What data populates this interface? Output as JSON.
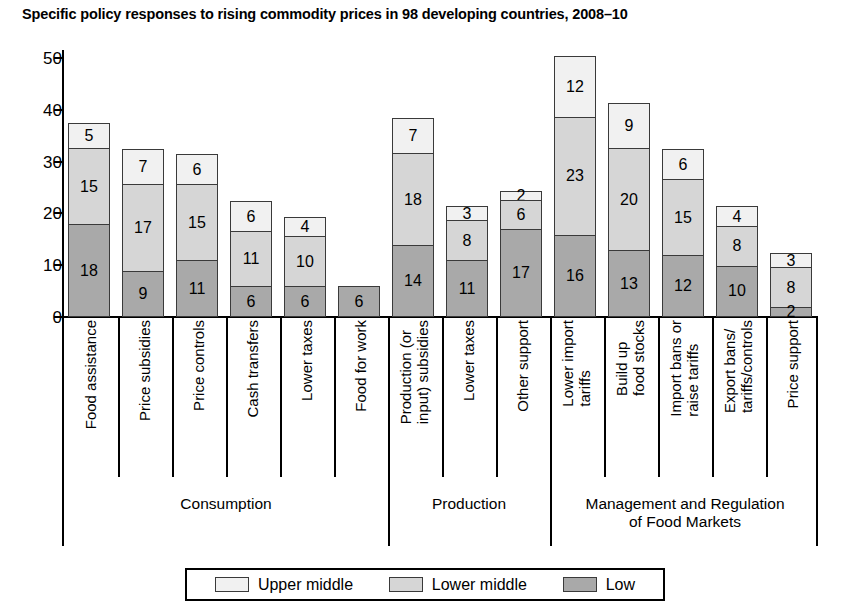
{
  "chart_data": {
    "type": "bar",
    "subtype": "stacked-vertical",
    "title": "Specific policy responses to rising commodity prices in 98 developing countries, 2008–10",
    "xlabel": "",
    "ylabel": "",
    "ylim": [
      0,
      50
    ],
    "yticks": [
      0,
      10,
      20,
      30,
      40,
      50
    ],
    "grid": false,
    "legend_position": "bottom",
    "categories": [
      "Food assistance",
      "Price subsidies",
      "Price controls",
      "Cash transfers",
      "Lower taxes",
      "Food for work",
      "Production (or\ninput) subsidies",
      "Lower taxes",
      "Other support",
      "Lower import\ntariffs",
      "Build up\nfood stocks",
      "Import bans or\nraise tariffs",
      "Export bans/\ntariffs/controls",
      "Price support"
    ],
    "series": [
      {
        "name": "Low",
        "color": "#a9a9a9",
        "values": [
          18,
          9,
          11,
          6,
          6,
          6,
          14,
          11,
          17,
          16,
          13,
          12,
          10,
          2
        ]
      },
      {
        "name": "Lower middle",
        "color": "#d6d6d6",
        "values": [
          15,
          17,
          15,
          11,
          10,
          null,
          18,
          8,
          6,
          23,
          20,
          15,
          8,
          8
        ]
      },
      {
        "name": "Upper middle",
        "color": "#f1f1f1",
        "values": [
          5,
          7,
          6,
          6,
          4,
          null,
          7,
          3,
          2,
          12,
          9,
          6,
          4,
          3
        ]
      }
    ],
    "totals": [
      38,
      33,
      32,
      23,
      20,
      6,
      39,
      22,
      25,
      51,
      42,
      33,
      22,
      13
    ],
    "groups": [
      {
        "label": "Consumption",
        "start": 0,
        "end": 5
      },
      {
        "label": "Production",
        "start": 6,
        "end": 8
      },
      {
        "label": "Management and Regulation\nof Food Markets",
        "start": 9,
        "end": 13
      }
    ]
  },
  "legend": {
    "items": [
      {
        "label": "Upper middle",
        "color": "#f1f1f1"
      },
      {
        "label": "Lower middle",
        "color": "#d6d6d6"
      },
      {
        "label": "Low",
        "color": "#a9a9a9"
      }
    ]
  }
}
